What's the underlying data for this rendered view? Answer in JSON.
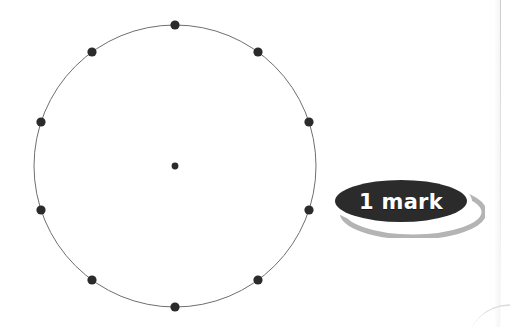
{
  "page": {
    "width": 510,
    "height": 327,
    "background_color": "#ffffff"
  },
  "figure": {
    "name": "circle-with-ten-equally-spaced-points",
    "circle": {
      "center_x": 175,
      "center_y": 166,
      "radius": 141,
      "stroke_color": "#6f6f6f",
      "stroke_width": 1,
      "fill": "none"
    },
    "center_point": {
      "x": 175,
      "y": 166,
      "radius": 3.4,
      "color": "#2b2b2b"
    },
    "point_color": "#2b2b2b",
    "point_radius": 4.6,
    "point_count": 10,
    "points": [
      {
        "label": "P1",
        "angle_deg": 90,
        "x": 175,
        "y": 25
      },
      {
        "label": "P2",
        "angle_deg": 54,
        "x": 258,
        "y": 52
      },
      {
        "label": "P3",
        "angle_deg": 18,
        "x": 309,
        "y": 122
      },
      {
        "label": "P4",
        "angle_deg": 342,
        "x": 309,
        "y": 210
      },
      {
        "label": "P5",
        "angle_deg": 306,
        "x": 258,
        "y": 280
      },
      {
        "label": "P6",
        "angle_deg": 270,
        "x": 175,
        "y": 307
      },
      {
        "label": "P7",
        "angle_deg": 234,
        "x": 92,
        "y": 280
      },
      {
        "label": "P8",
        "angle_deg": 198,
        "x": 41,
        "y": 210
      },
      {
        "label": "P9",
        "angle_deg": 162,
        "x": 41,
        "y": 122
      },
      {
        "label": "P10",
        "angle_deg": 126,
        "x": 92,
        "y": 52
      }
    ]
  },
  "badge": {
    "text": "1 mark",
    "fill_color": "#2b2b2b",
    "ring_color": "#ffffff",
    "text_color": "#ffffff",
    "shadow_color": "#b4b4b4"
  },
  "artifacts": {
    "right_edge_line_color": "#cdcdcd",
    "corner_curve_color": "#d8d8d8"
  }
}
